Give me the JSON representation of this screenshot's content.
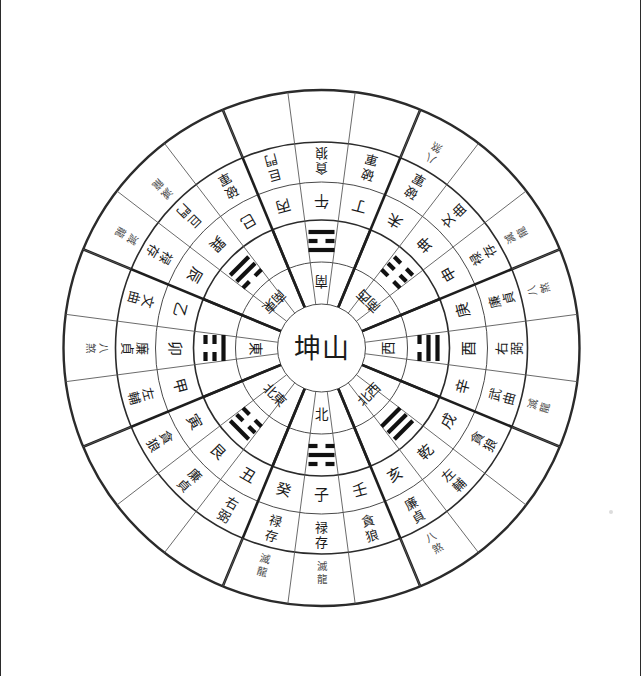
{
  "diagram": {
    "kind": "luopan-compass",
    "title_center": "坤山",
    "center_label": "坤山",
    "inner_circle_radius": 44,
    "rings": [
      {
        "name": "direction-ring",
        "inner_r": 44,
        "outer_r": 86
      },
      {
        "name": "trigram-ring",
        "inner_r": 86,
        "outer_r": 128
      },
      {
        "name": "twentyfour-mountain-ring",
        "inner_r": 128,
        "outer_r": 166
      },
      {
        "name": "nine-star-ring",
        "inner_r": 166,
        "outer_r": 206
      },
      {
        "name": "omen-ring",
        "inner_r": 206,
        "outer_r": 258
      }
    ],
    "colors": {
      "background": "#ffffff",
      "ink": "#1a1a1a",
      "hairline": "#5a5a5a",
      "heavy_line": "#1e1e1e",
      "omen_text": "#4c4c4c"
    }
  },
  "directions": [
    {
      "label": "北",
      "angle": 90,
      "name": "north"
    },
    {
      "label": "北東",
      "angle": 135,
      "name": "northeast"
    },
    {
      "label": "東",
      "angle": 180,
      "name": "east"
    },
    {
      "label": "南東",
      "angle": 225,
      "name": "southeast"
    },
    {
      "label": "南",
      "angle": 270,
      "name": "south"
    },
    {
      "label": "南西",
      "angle": 315,
      "name": "southwest"
    },
    {
      "label": "西",
      "angle": 0,
      "name": "west"
    },
    {
      "label": "北西",
      "angle": 45,
      "name": "northwest"
    }
  ],
  "trigrams": [
    {
      "name": "kan",
      "angle": 90,
      "lines": [
        0,
        1,
        0
      ]
    },
    {
      "name": "gen",
      "angle": 135,
      "lines": [
        0,
        0,
        1
      ]
    },
    {
      "name": "zhen",
      "angle": 180,
      "lines": [
        1,
        0,
        0
      ]
    },
    {
      "name": "xun",
      "angle": 225,
      "lines": [
        0,
        1,
        1
      ]
    },
    {
      "name": "li",
      "angle": 270,
      "lines": [
        1,
        0,
        1
      ]
    },
    {
      "name": "kun",
      "angle": 315,
      "lines": [
        0,
        0,
        0
      ]
    },
    {
      "name": "dui",
      "angle": 0,
      "lines": [
        0,
        1,
        1
      ]
    },
    {
      "name": "qian",
      "angle": 45,
      "lines": [
        1,
        1,
        1
      ]
    }
  ],
  "mountains": [
    {
      "label": "子",
      "angle": 90,
      "star": "禄存",
      "omen": "滅龍"
    },
    {
      "label": "癸",
      "angle": 105,
      "star": "禄存",
      "omen": "滅龍"
    },
    {
      "label": "丑",
      "angle": 120,
      "star": "右弼",
      "omen": ""
    },
    {
      "label": "艮",
      "angle": 135,
      "star": "廉貞",
      "omen": ""
    },
    {
      "label": "寅",
      "angle": 150,
      "star": "貪狼",
      "omen": ""
    },
    {
      "label": "甲",
      "angle": 165,
      "star": "左輔",
      "omen": ""
    },
    {
      "label": "卯",
      "angle": 180,
      "star": "廉貞",
      "omen": "八煞"
    },
    {
      "label": "乙",
      "angle": 195,
      "star": "文曲",
      "omen": ""
    },
    {
      "label": "辰",
      "angle": 210,
      "star": "禄存",
      "omen": "滅龍"
    },
    {
      "label": "巽",
      "angle": 225,
      "star": "巨門",
      "omen": "滅龍"
    },
    {
      "label": "巳",
      "angle": 240,
      "star": "破軍",
      "omen": ""
    },
    {
      "label": "丙",
      "angle": 255,
      "star": "巨門",
      "omen": ""
    },
    {
      "label": "午",
      "angle": 270,
      "star": "貪狼",
      "omen": ""
    },
    {
      "label": "丁",
      "angle": 285,
      "star": "破軍",
      "omen": ""
    },
    {
      "label": "未",
      "angle": 300,
      "star": "破軍",
      "omen": "八煞"
    },
    {
      "label": "坤",
      "angle": 315,
      "star": "文曲",
      "omen": ""
    },
    {
      "label": "申",
      "angle": 330,
      "star": "禄存",
      "omen": "滅龍"
    },
    {
      "label": "庚",
      "angle": 345,
      "star": "廉貞",
      "omen": "八煞"
    },
    {
      "label": "酉",
      "angle": 0,
      "star": "右弼",
      "omen": ""
    },
    {
      "label": "辛",
      "angle": 15,
      "star": "武曲",
      "omen": "滅龍"
    },
    {
      "label": "戌",
      "angle": 30,
      "star": "貪狼",
      "omen": ""
    },
    {
      "label": "乾",
      "angle": 45,
      "star": "左輔",
      "omen": ""
    },
    {
      "label": "亥",
      "angle": 60,
      "star": "廉貞",
      "omen": "八煞"
    },
    {
      "label": "壬",
      "angle": 75,
      "star": "貪狼",
      "omen": ""
    }
  ],
  "nine_stars_legend": [
    "貪狼",
    "巨門",
    "禄存",
    "文曲",
    "廉貞",
    "武曲",
    "破軍",
    "左輔",
    "右弼"
  ],
  "omen_legend": [
    "八煞",
    "滅龍"
  ]
}
